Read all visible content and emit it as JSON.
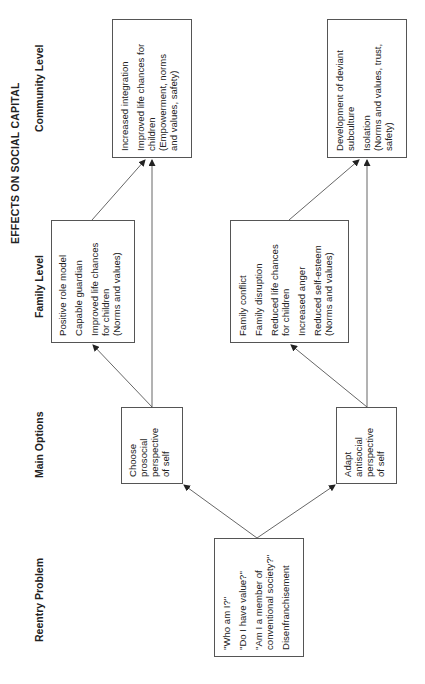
{
  "title": "EFFECTS ON SOCIAL CAPITAL",
  "column_labels": {
    "community": "Community Level",
    "family": "Family Level",
    "main": "Main Options",
    "reentry": "Reentry Problem"
  },
  "boxes": {
    "reentry": {
      "items": [
        [
          "\"Who am I?\""
        ],
        [
          "\"Do I have value?\""
        ],
        [
          "\"Am I a member of",
          "conventional society?\""
        ],
        [
          "Disenfranchisement"
        ]
      ]
    },
    "main_prosocial": {
      "items": [
        [
          "Choose",
          "prosocial",
          "perspective",
          "of self"
        ]
      ]
    },
    "main_antisocial": {
      "items": [
        [
          "Adapt",
          "antisocial",
          "perspective",
          "of self"
        ]
      ]
    },
    "family_prosocial": {
      "items": [
        [
          "Positive role model"
        ],
        [
          "Capable guardian"
        ],
        [
          "Improved life chances",
          "for children",
          "(Norms and values)"
        ]
      ]
    },
    "family_antisocial": {
      "items": [
        [
          "Family conflict"
        ],
        [
          "Family disruption"
        ],
        [
          "Reduced life chances",
          "for children"
        ],
        [
          "Increased anger"
        ],
        [
          "Reduced self-esteem",
          "(Norms and values)"
        ]
      ]
    },
    "community_prosocial": {
      "items": [
        [
          "Increased integration"
        ],
        [
          "Improved life chances for",
          "children",
          "(Empowerment, norms",
          "and values, safety)"
        ]
      ]
    },
    "community_antisocial": {
      "items": [
        [
          "Development of deviant",
          "subculture"
        ],
        [
          "Isolation",
          "(Norms and values, trust,",
          "safety)"
        ]
      ]
    }
  },
  "colors": {
    "line": "#555555",
    "text": "#222222",
    "background": "#ffffff"
  }
}
